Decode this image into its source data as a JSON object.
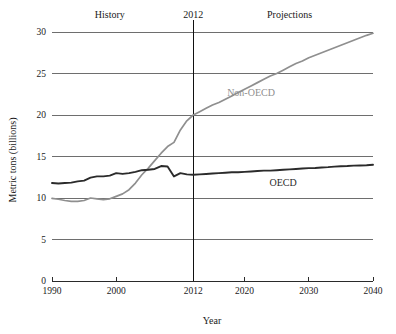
{
  "chart_data": {
    "type": "line",
    "title": "",
    "xlabel": "Year",
    "ylabel": "Metric tons (billions)",
    "xlim": [
      1990,
      2040
    ],
    "ylim": [
      0,
      30
    ],
    "xticks": [
      "1990",
      "2000",
      "2012",
      "2020",
      "2030",
      "2040"
    ],
    "xtick_values": [
      1990,
      2000,
      2012,
      2020,
      2030,
      2040
    ],
    "yticks": [
      "0",
      "5",
      "10",
      "15",
      "20",
      "25",
      "30"
    ],
    "ytick_values": [
      0,
      5,
      10,
      15,
      20,
      25,
      30
    ],
    "grid": "horizontal",
    "legend_position": "inline-annotation",
    "annotations": [
      {
        "name": "history",
        "text": "History",
        "x": 1999,
        "y": 31.2
      },
      {
        "name": "divider-year",
        "text": "2012",
        "x": 2012,
        "y": 31.2
      },
      {
        "name": "projections",
        "text": "Projections",
        "x": 2027,
        "y": 31.2
      }
    ],
    "divider_x": 2012,
    "series": [
      {
        "name": "Non-OECD",
        "color": "#8f8f8f",
        "label_x": 2021,
        "label_y": 22.3,
        "x": [
          1990,
          1991,
          1992,
          1993,
          1994,
          1995,
          1996,
          1997,
          1998,
          1999,
          2000,
          2001,
          2002,
          2003,
          2004,
          2005,
          2006,
          2007,
          2008,
          2009,
          2010,
          2011,
          2012,
          2013,
          2014,
          2015,
          2016,
          2017,
          2018,
          2019,
          2020,
          2021,
          2022,
          2023,
          2024,
          2025,
          2026,
          2027,
          2028,
          2029,
          2030,
          2031,
          2032,
          2033,
          2034,
          2035,
          2036,
          2037,
          2038,
          2039,
          2040
        ],
        "values": [
          9.95,
          9.85,
          9.7,
          9.6,
          9.6,
          9.7,
          10.0,
          9.9,
          9.8,
          9.9,
          10.2,
          10.5,
          11.0,
          11.8,
          12.8,
          13.6,
          14.5,
          15.4,
          16.2,
          16.7,
          18.2,
          19.3,
          20.0,
          20.4,
          20.8,
          21.2,
          21.5,
          21.9,
          22.3,
          22.7,
          23.1,
          23.5,
          23.9,
          24.3,
          24.7,
          25.0,
          25.4,
          25.8,
          26.2,
          26.5,
          26.9,
          27.2,
          27.5,
          27.8,
          28.1,
          28.4,
          28.7,
          29.0,
          29.3,
          29.6,
          29.85
        ]
      },
      {
        "name": "OECD",
        "color": "#2b2b2b",
        "label_x": 2026,
        "label_y": 11.5,
        "x": [
          1990,
          1991,
          1992,
          1993,
          1994,
          1995,
          1996,
          1997,
          1998,
          1999,
          2000,
          2001,
          2002,
          2003,
          2004,
          2005,
          2006,
          2007,
          2008,
          2009,
          2010,
          2011,
          2012,
          2013,
          2014,
          2015,
          2016,
          2017,
          2018,
          2019,
          2020,
          2021,
          2022,
          2023,
          2024,
          2025,
          2026,
          2027,
          2028,
          2029,
          2030,
          2031,
          2032,
          2033,
          2034,
          2035,
          2036,
          2037,
          2038,
          2039,
          2040
        ],
        "values": [
          11.8,
          11.75,
          11.8,
          11.85,
          12.0,
          12.1,
          12.45,
          12.6,
          12.6,
          12.7,
          13.0,
          12.9,
          13.0,
          13.15,
          13.35,
          13.4,
          13.5,
          13.85,
          13.8,
          12.6,
          13.0,
          12.85,
          12.8,
          12.85,
          12.9,
          12.95,
          13.0,
          13.05,
          13.1,
          13.1,
          13.15,
          13.2,
          13.25,
          13.3,
          13.3,
          13.35,
          13.4,
          13.45,
          13.5,
          13.55,
          13.6,
          13.62,
          13.68,
          13.72,
          13.78,
          13.82,
          13.85,
          13.9,
          13.92,
          13.95,
          14.0
        ]
      }
    ]
  },
  "axes": {
    "y_title": "Metric tons (billions)",
    "x_title": "Year"
  }
}
